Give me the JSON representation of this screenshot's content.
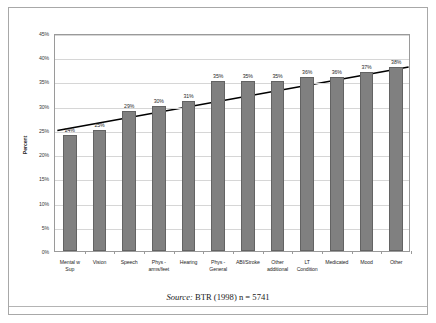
{
  "figure": {
    "source_caption_label": "Source:",
    "source_caption_text": " BTR (1998) n = 5741"
  },
  "chart_data": {
    "type": "bar",
    "title": "",
    "xlabel": "",
    "ylabel": "Percent",
    "ylim": [
      0,
      45
    ],
    "ytick_labels": [
      "0%",
      "5%",
      "10%",
      "15%",
      "20%",
      "25%",
      "30%",
      "35%",
      "40%",
      "45%"
    ],
    "ytick_values": [
      0,
      5,
      10,
      15,
      20,
      25,
      30,
      35,
      40,
      45
    ],
    "grid": true,
    "legend": "none",
    "bar_color": "#808080",
    "bar_edge_color": "#636363",
    "trendline": {
      "present": true,
      "type": "linear",
      "color": "#000000",
      "start_value": 25.3,
      "end_value": 38.4
    },
    "categories": [
      "Mental w Sup",
      "Vision",
      "Speech",
      "Phys - arms/feet",
      "Hearing",
      "Phys - General",
      "ABI/Stroke",
      "Other additional",
      "LT Condition",
      "Medicated",
      "Mood",
      "Other"
    ],
    "category_lines": [
      [
        "Mental w",
        "Sup"
      ],
      [
        "Vision"
      ],
      [
        "Speech"
      ],
      [
        "Phys -",
        "arms/feet"
      ],
      [
        "Hearing"
      ],
      [
        "Phys -",
        "General"
      ],
      [
        "ABI/Stroke"
      ],
      [
        "Other",
        "additional"
      ],
      [
        "LT",
        "Condition"
      ],
      [
        "Medicated"
      ],
      [
        "Mood"
      ],
      [
        "Other"
      ]
    ],
    "values": [
      24,
      25,
      29,
      30,
      31,
      35,
      35,
      35,
      36,
      36,
      37,
      38
    ],
    "data_labels": [
      "24%",
      "25%",
      "29%",
      "30%",
      "31%",
      "35%",
      "35%",
      "35%",
      "36%",
      "36%",
      "37%",
      "38%"
    ]
  }
}
